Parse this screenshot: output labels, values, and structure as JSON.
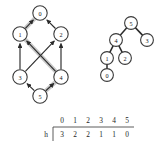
{
  "figure": {
    "background_color": "#ffffff",
    "node_fill": "#ffffff",
    "node_stroke": "#3a3a3a",
    "edge_color": "#2b2b2b",
    "highlight_color": "#c9c9c9"
  },
  "dag": {
    "title": "",
    "nodes": [
      {
        "id": "0",
        "label": "0",
        "cx": 40,
        "cy": 13,
        "r": 7.2
      },
      {
        "id": "1",
        "label": "1",
        "cx": 20,
        "cy": 34,
        "r": 7.2
      },
      {
        "id": "2",
        "label": "2",
        "cx": 61,
        "cy": 34,
        "r": 7.2
      },
      {
        "id": "3",
        "label": "3",
        "cx": 20,
        "cy": 77,
        "r": 7.2
      },
      {
        "id": "4",
        "label": "4",
        "cx": 61,
        "cy": 77,
        "r": 7.2
      },
      {
        "id": "5",
        "label": "5",
        "cx": 40,
        "cy": 96,
        "r": 7.2
      }
    ],
    "edges": [
      {
        "from": "1",
        "to": "0",
        "directed": true,
        "highlighted": true
      },
      {
        "from": "2",
        "to": "0",
        "directed": true,
        "highlighted": false
      },
      {
        "from": "3",
        "to": "1",
        "directed": true,
        "highlighted": false
      },
      {
        "from": "4",
        "to": "2",
        "directed": true,
        "highlighted": false
      },
      {
        "from": "3",
        "to": "2",
        "directed": true,
        "highlighted": false
      },
      {
        "from": "4",
        "to": "1",
        "directed": true,
        "highlighted": true
      },
      {
        "from": "5",
        "to": "3",
        "directed": true,
        "highlighted": false
      },
      {
        "from": "5",
        "to": "4",
        "directed": true,
        "highlighted": true
      }
    ],
    "highlighted_path": [
      "5",
      "4",
      "1",
      "0"
    ]
  },
  "tree": {
    "title": "",
    "nodes": [
      {
        "id": "5",
        "label": "5",
        "cx": 131,
        "cy": 23,
        "r": 6.4
      },
      {
        "id": "4",
        "label": "4",
        "cx": 116,
        "cy": 40,
        "r": 6.4
      },
      {
        "id": "3",
        "label": "3",
        "cx": 147,
        "cy": 40,
        "r": 6.4
      },
      {
        "id": "1",
        "label": "1",
        "cx": 107,
        "cy": 58,
        "r": 6.4
      },
      {
        "id": "2",
        "label": "2",
        "cx": 125,
        "cy": 58,
        "r": 6.4
      },
      {
        "id": "0",
        "label": "0",
        "cx": 107,
        "cy": 75,
        "r": 6.4
      }
    ],
    "edges": [
      {
        "from": "5",
        "to": "4"
      },
      {
        "from": "5",
        "to": "3"
      },
      {
        "from": "4",
        "to": "1"
      },
      {
        "from": "4",
        "to": "2"
      },
      {
        "from": "1",
        "to": "0"
      }
    ]
  },
  "table": {
    "row_label": "h",
    "columns": [
      "0",
      "1",
      "2",
      "3",
      "4",
      "5"
    ],
    "values": [
      "3",
      "2",
      "2",
      "1",
      "1",
      "0"
    ],
    "column_x": [
      62,
      75,
      88,
      101,
      114,
      127
    ],
    "header_y": 120,
    "values_y": 134,
    "row_label_x": 46,
    "rule_y": 127,
    "rule_x1": 53,
    "rule_x2": 134,
    "vrule_x": 53,
    "vrule_y1": 127,
    "vrule_y2": 141
  },
  "chart_data": {
    "type": "diagram",
    "dag_nodes": [
      "0",
      "1",
      "2",
      "3",
      "4",
      "5"
    ],
    "dag_edges": [
      [
        "1",
        "0"
      ],
      [
        "2",
        "0"
      ],
      [
        "3",
        "1"
      ],
      [
        "4",
        "2"
      ],
      [
        "3",
        "2"
      ],
      [
        "4",
        "1"
      ],
      [
        "5",
        "3"
      ],
      [
        "5",
        "4"
      ]
    ],
    "highlighted_path": [
      "5",
      "4",
      "1",
      "0"
    ],
    "tree_root": "5",
    "tree_edges": [
      [
        "5",
        "4"
      ],
      [
        "5",
        "3"
      ],
      [
        "4",
        "1"
      ],
      [
        "4",
        "2"
      ],
      [
        "1",
        "0"
      ]
    ],
    "table_header": [
      "0",
      "1",
      "2",
      "3",
      "4",
      "5"
    ],
    "table_row_label": "h",
    "table_values": [
      3,
      2,
      2,
      1,
      1,
      0
    ]
  }
}
